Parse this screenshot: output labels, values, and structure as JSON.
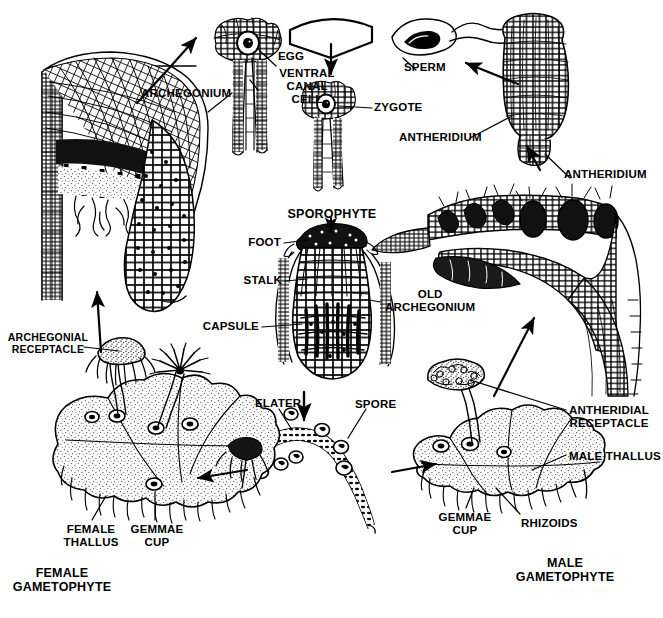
{
  "diagram": {
    "ink_color": "#000000",
    "background_color": "#ffffff"
  },
  "labels": {
    "archegonium": "ARCHEGONIUM",
    "egg": "EGG",
    "ventral_canal_cell": "VENTRAL\nCANAL\nCELL",
    "sperm": "SPERM",
    "zygote": "ZYGOTE",
    "antheridium_left": "ANTHERIDIUM",
    "antheridium_right": "ANTHERIDIUM",
    "sporophyte": "SPOROPHYTE",
    "foot": "FOOT",
    "stalk": "STALK",
    "capsule": "CAPSULE",
    "old_archegonium": "OLD\nARCHEGONIUM",
    "elater": "ELATER",
    "spore": "SPORE",
    "archegonial_receptacle": "ARCHEGONIAL\nRECEPTACLE",
    "female_thallus": "FEMALE\nTHALLUS",
    "gemmae_cup_female": "GEMMAE\nCUP",
    "female_gametophyte": "FEMALE\nGAMETOPHYTE",
    "antheridial_receptacle": "ANTHERIDIAL\nRECEPTACLE",
    "male_thallus": "MALE THALLUS",
    "gemmae_cup_male": "GEMMAE\nCUP",
    "rhizoids": "RHIZOIDS",
    "male_gametophyte": "MALE\nGAMETOPHYTE"
  }
}
